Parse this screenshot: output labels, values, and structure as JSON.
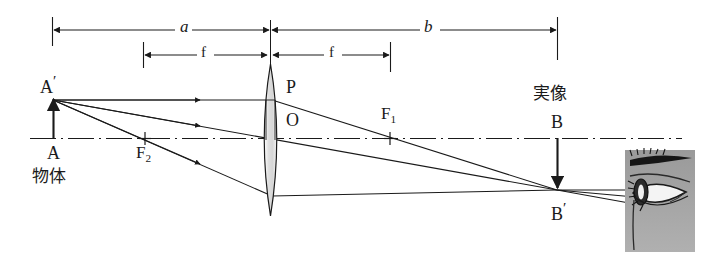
{
  "figure": {
    "width": 705,
    "height": 259,
    "background_color": "#ffffff",
    "line_color": "#1a1a1a",
    "lens_fill_color": "#e0e0e0",
    "eye_fill_color": "#a6a6a6"
  },
  "dimensions": {
    "object_distance": {
      "label": "a",
      "x_start": 52,
      "x_end": 270,
      "y": 30
    },
    "focal_left": {
      "label": "f",
      "x_start": 143,
      "x_end": 268,
      "y": 55
    },
    "focal_right": {
      "label": "f",
      "x_start": 272,
      "x_end": 390,
      "y": 55
    },
    "image_distance": {
      "label": "b",
      "x_start": 272,
      "x_end": 557,
      "y": 30
    }
  },
  "points": {
    "object_tip": {
      "label": "A",
      "prime": "′",
      "x": 53,
      "y": 100
    },
    "object_base": {
      "label": "A",
      "x": 53,
      "y": 138
    },
    "object_name": {
      "label": "物体"
    },
    "focus_left": {
      "label": "F",
      "subscript": "2",
      "x": 145,
      "y": 138
    },
    "focus_right": {
      "label": "F",
      "subscript": "1",
      "x": 390,
      "y": 138
    },
    "lens_top_point": {
      "label": "P",
      "x": 277,
      "y": 93
    },
    "lens_center": {
      "label": "O",
      "x": 277,
      "y": 123
    },
    "image_base": {
      "label": "B",
      "x": 557,
      "y": 138
    },
    "image_tip": {
      "label": "B",
      "prime": "′",
      "x": 557,
      "y": 190
    },
    "image_name": {
      "label": "実像"
    }
  },
  "labels": {
    "a": "a",
    "b": "b",
    "f_left": "f",
    "f_right": "f",
    "A_prime": "A",
    "A": "A",
    "object_cjk": "物体",
    "F_left": "F",
    "F_left_sub": "2",
    "F_right": "F",
    "F_right_sub": "1",
    "P": "P",
    "O": "O",
    "B": "B",
    "B_prime": "B",
    "image_cjk": "実像",
    "prime_mark": "′"
  },
  "optical_axis": {
    "y": 138,
    "x_start": 30,
    "x_end": 682,
    "style": "dash-dot"
  },
  "lens": {
    "center_x": 270,
    "top_y": 64,
    "bottom_y": 216,
    "half_width": 12
  },
  "rays": [
    {
      "name": "parallel-ray",
      "from": [
        53,
        100
      ],
      "via": [
        270,
        100
      ],
      "to": [
        557,
        190
      ],
      "description": "parallel to axis then refracted through F1"
    },
    {
      "name": "center-ray",
      "from": [
        53,
        100
      ],
      "via": [
        270,
        138
      ],
      "to": [
        557,
        190
      ],
      "description": "straight through lens centre O"
    },
    {
      "name": "focal-ray",
      "from": [
        53,
        100
      ],
      "via": [
        270,
        196
      ],
      "to": [
        557,
        190
      ],
      "description": "through front focus F2 then parallel to axis"
    }
  ],
  "eye": {
    "x": 625,
    "y": 150,
    "width": 70,
    "height": 102,
    "incoming_ray_count": 3
  }
}
